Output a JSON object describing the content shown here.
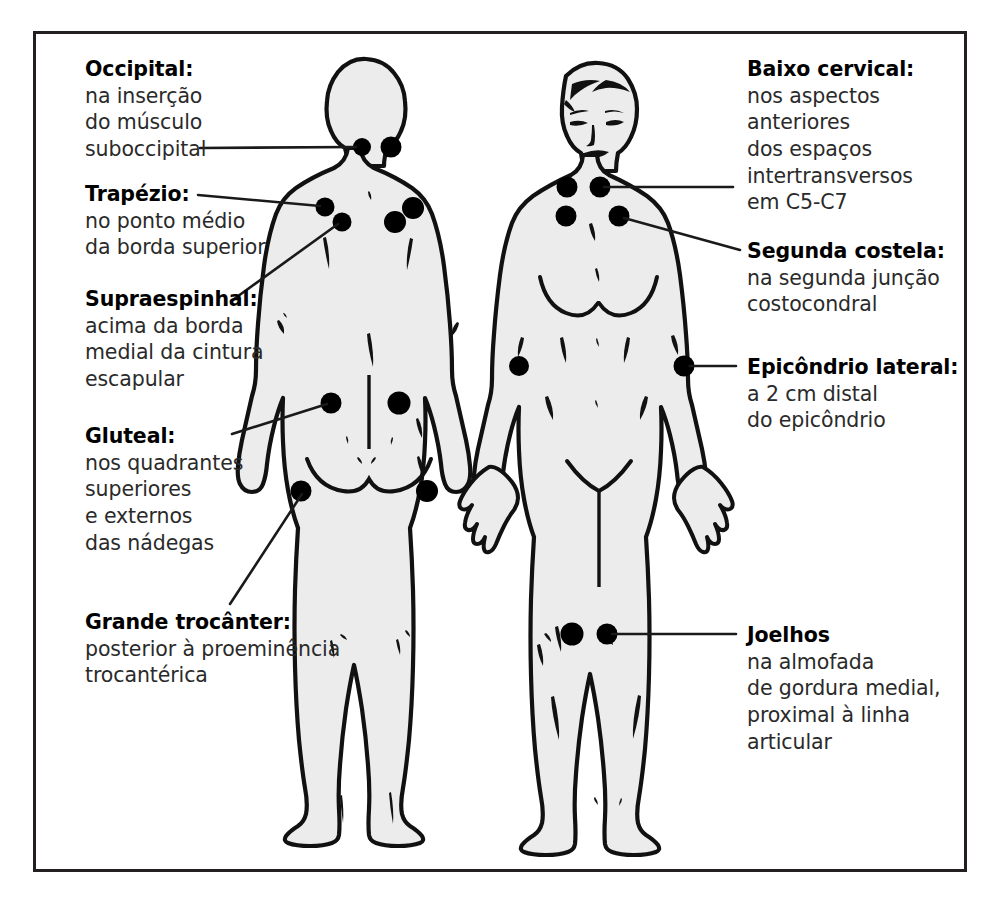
{
  "diagram": {
    "language": "pt-BR",
    "frame_color": "#231f20",
    "body_fill": "#ececec",
    "point_color": "#000000",
    "figures": [
      {
        "name": "posterior-figure",
        "view": "posterior"
      },
      {
        "name": "anterior-figure",
        "view": "anterior"
      }
    ]
  },
  "callouts_left": [
    {
      "id": "occipital",
      "title": "Occipital:",
      "body": "na inserção\ndo músculo\nsuboccipital"
    },
    {
      "id": "trapezio",
      "title": "Trapézio:",
      "body": "no ponto médio\nda borda superior"
    },
    {
      "id": "supraespinhal",
      "title": "Supraespinhal:",
      "body": "acima da borda\nmedial da cintura\nescapular"
    },
    {
      "id": "gluteal",
      "title": "Gluteal:",
      "body": "nos quadrantes\nsuperiores\ne externos\ndas nádegas"
    },
    {
      "id": "grande-trocanter",
      "title": "Grande trocânter:",
      "body": "posterior à proeminência\ntrocantérica"
    }
  ],
  "callouts_right": [
    {
      "id": "baixo-cervical",
      "title": "Baixo cervical:",
      "body": "nos aspectos\nanteriores\ndos espaços\nintertransversos\nem C5-C7"
    },
    {
      "id": "segunda-costela",
      "title": "Segunda costela:",
      "body": "na segunda junção\ncostocondral"
    },
    {
      "id": "epicondrio-lateral",
      "title": "Epicôndrio lateral:",
      "body": "a 2 cm distal\ndo epicôndrio"
    },
    {
      "id": "joelhos",
      "title": "Joelhos",
      "body": "na almofada\nde gordura medial,\nproximal à linha\narticular"
    }
  ]
}
